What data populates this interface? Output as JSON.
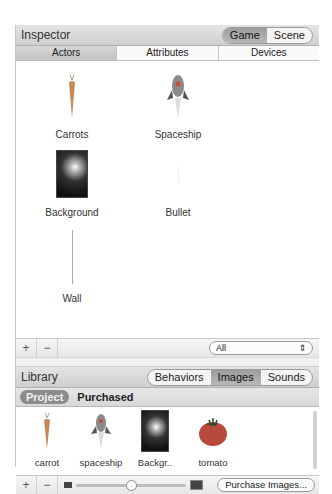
{
  "inspector": {
    "title": "Inspector",
    "mode_toggle": [
      {
        "label": "Game",
        "active": true
      },
      {
        "label": "Scene",
        "active": false
      }
    ],
    "tabs": [
      {
        "label": "Actors",
        "active": true
      },
      {
        "label": "Attributes",
        "active": false
      },
      {
        "label": "Devices",
        "active": false
      }
    ],
    "actors": [
      {
        "label": "Carrots",
        "icon": "carrot-icon"
      },
      {
        "label": "Spaceship",
        "icon": "spaceship-icon"
      },
      {
        "label": "Background",
        "icon": "background-image"
      },
      {
        "label": "Bullet",
        "icon": "bullet-icon"
      },
      {
        "label": "Wall",
        "icon": "wall-icon"
      }
    ],
    "footer": {
      "add": "+",
      "remove": "−",
      "filter_value": "All",
      "filter_arrows": "⇕"
    }
  },
  "library": {
    "title": "Library",
    "mode_toggle": [
      {
        "label": "Behaviors",
        "active": false
      },
      {
        "label": "Images",
        "active": true
      },
      {
        "label": "Sounds",
        "active": false
      }
    ],
    "subtabs": [
      {
        "label": "Project",
        "active": true
      },
      {
        "label": "Purchased",
        "active": false
      }
    ],
    "items": [
      {
        "label": "carrot",
        "icon": "carrot-icon"
      },
      {
        "label": "spaceship",
        "icon": "spaceship-icon"
      },
      {
        "label": "Backgr..",
        "icon": "background-image"
      },
      {
        "label": "tomato",
        "icon": "tomato-icon"
      }
    ],
    "footer": {
      "add": "+",
      "remove": "−",
      "purchase_label": "Purchase Images..."
    }
  }
}
